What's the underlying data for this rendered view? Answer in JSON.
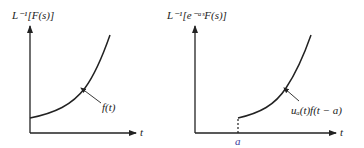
{
  "left_plot": {
    "ylabel": "L⁻¹[F(s)]",
    "xlabel": "t",
    "curve_label": "f(t)"
  },
  "right_plot": {
    "ylabel": "L⁻¹[e⁻ᵃˢF(s)]",
    "xlabel": "t",
    "curve_label": "uₐ(t)f(t − a)",
    "shift_tick": "a"
  },
  "colors": {
    "ink": "#222222",
    "tick_label": "#3a3a9a"
  }
}
